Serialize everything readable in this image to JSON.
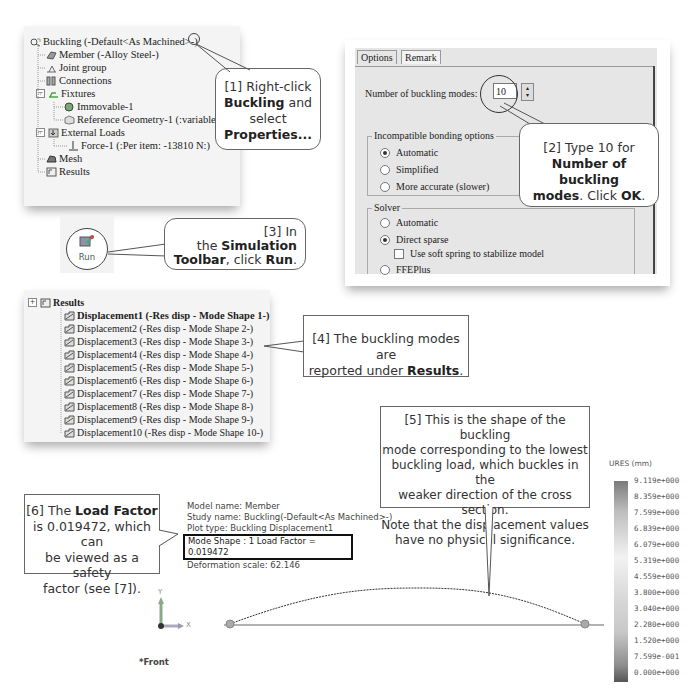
{
  "feature_tree": {
    "root": "Buckling (-Default<As Machined>-)",
    "items": [
      {
        "label": "Member (-Alloy Steel-)",
        "icon": "part-icon"
      },
      {
        "label": "Joint group",
        "icon": "joint-group-icon"
      },
      {
        "label": "Connections",
        "icon": "connections-icon"
      },
      {
        "label": "Fixtures",
        "icon": "fixtures-icon",
        "expander": "−"
      },
      {
        "label": "Immovable-1",
        "icon": "fixed-icon"
      },
      {
        "label": "Reference Geometry-1 (:variable:)",
        "icon": "reference-geometry-icon"
      },
      {
        "label": "External Loads",
        "icon": "external-loads-icon",
        "expander": "−"
      },
      {
        "label": "Force-1 (:Per item: -13810 N:)",
        "icon": "force-icon"
      },
      {
        "label": "Mesh",
        "icon": "mesh-icon"
      },
      {
        "label": "Results",
        "icon": "results-folder-icon"
      }
    ]
  },
  "callouts": {
    "c1": {
      "pre": "[1] Right-click",
      "b1": "Buckling",
      "mid": " and select",
      "b2": "Properties..."
    },
    "c2": {
      "pre": "[2] Type 10 for",
      "b1": "Number of buckling",
      "b2": "modes",
      "mid": ". Click ",
      "b3": "OK",
      "post": "."
    },
    "c3": {
      "pre": "[3] In",
      "mid": "the ",
      "b1": "Simulation",
      "b2": "Toolbar",
      "mid2": ", click ",
      "b3": "Run",
      "post": "."
    },
    "c4": {
      "pre": "[4] The buckling modes are",
      "mid": "reported under ",
      "b1": "Results",
      "post": "."
    },
    "c5": {
      "lines": [
        "[5] This is the shape of the buckling",
        "mode corresponding to the lowest",
        "buckling load, which buckles in the",
        "weaker direction of the cross section.",
        "Note that the displacement values",
        "have no physical significance."
      ]
    },
    "c6": {
      "pre": "[6] The ",
      "b1": "Load Factor",
      "l2": "is 0.019472, which can",
      "l3": "be viewed as a safety",
      "l4": "factor (see [7])."
    }
  },
  "dialog": {
    "tabs": [
      "Options",
      "Remark"
    ],
    "modes_label": "Number of buckling modes:",
    "modes_value": "10",
    "bonding": {
      "title": "Incompatible bonding options",
      "options": [
        {
          "label": "Automatic",
          "selected": true
        },
        {
          "label": "Simplified",
          "selected": false
        },
        {
          "label": "More accurate (slower)",
          "selected": false
        }
      ]
    },
    "solver": {
      "title": "Solver",
      "options": [
        {
          "label": "Automatic",
          "selected": false
        },
        {
          "label": "Direct sparse",
          "selected": true
        },
        {
          "label": "FFEPlus",
          "selected": false
        }
      ],
      "checkbox": {
        "label": "Use soft spring to stabilize model",
        "checked": false
      }
    }
  },
  "toolbar": {
    "run_label": "Run"
  },
  "results": {
    "folder": "Results",
    "items": [
      "Displacement1  (-Res disp - Mode Shape 1-)",
      "Displacement2 (-Res disp - Mode Shape 2-)",
      "Displacement3 (-Res disp - Mode Shape 3-)",
      "Displacement4 (-Res disp - Mode Shape 4-)",
      "Displacement5 (-Res disp - Mode Shape 5-)",
      "Displacement6 (-Res disp - Mode Shape 6-)",
      "Displacement7 (-Res disp - Mode Shape 7-)",
      "Displacement8 (-Res disp - Mode Shape 8-)",
      "Displacement9 (-Res disp - Mode Shape 9-)",
      "Displacement10 (-Res disp - Mode Shape 10-)"
    ]
  },
  "plot": {
    "model_name": "Model name: Member",
    "study_name": "Study name: Buckling(-Default<As Machined>-)",
    "plot_type": "Plot type: Buckling Displacement1",
    "mode_shape": "Mode Shape : 1  Load Factor = 0.019472",
    "deformation_scale": "Deformation scale: 62.146",
    "view": "*Front",
    "axis_x": "X",
    "axis_y": "Y"
  },
  "legend": {
    "title": "URES (mm)",
    "values": [
      "9.119e+000",
      "8.359e+000",
      "7.599e+000",
      "6.839e+000",
      "6.079e+000",
      "5.319e+000",
      "4.559e+000",
      "3.800e+000",
      "3.040e+000",
      "2.280e+000",
      "1.520e+000",
      "7.599e-001",
      "0.000e+000"
    ]
  }
}
